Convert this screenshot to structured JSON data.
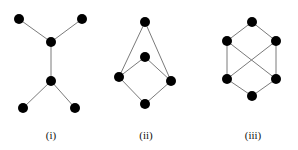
{
  "graphs": [
    {
      "label": "(i)",
      "label_x": 51,
      "nodes": [
        [
          19,
          19
        ],
        [
          82,
          19
        ],
        [
          51,
          42
        ],
        [
          51,
          81
        ],
        [
          23,
          108
        ],
        [
          75,
          108
        ]
      ],
      "edges": [
        [
          0,
          2
        ],
        [
          1,
          2
        ],
        [
          2,
          3
        ],
        [
          3,
          4
        ],
        [
          3,
          5
        ]
      ]
    },
    {
      "label": "(ii)",
      "label_x": 146,
      "nodes": [
        [
          145,
          22
        ],
        [
          145,
          57
        ],
        [
          119,
          77
        ],
        [
          171,
          81
        ],
        [
          145,
          104
        ]
      ],
      "edges": [
        [
          0,
          2
        ],
        [
          0,
          3
        ],
        [
          1,
          2
        ],
        [
          1,
          3
        ],
        [
          2,
          4
        ],
        [
          3,
          4
        ]
      ]
    },
    {
      "label": "(iii)",
      "label_x": 253,
      "nodes": [
        [
          252,
          22
        ],
        [
          227,
          41
        ],
        [
          276,
          41
        ],
        [
          227,
          79
        ],
        [
          276,
          79
        ],
        [
          252,
          96
        ]
      ],
      "edges": [
        [
          0,
          1
        ],
        [
          0,
          2
        ],
        [
          1,
          3
        ],
        [
          2,
          4
        ],
        [
          1,
          4
        ],
        [
          2,
          3
        ],
        [
          3,
          5
        ],
        [
          4,
          5
        ]
      ]
    }
  ],
  "style": {
    "node_color": "#000000",
    "edge_color": "#7a7a7a",
    "node_radius": 5
  }
}
